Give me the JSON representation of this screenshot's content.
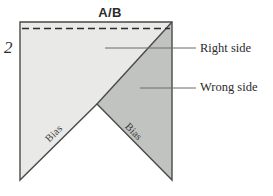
{
  "figure": {
    "title": "A/B",
    "step_number": "2",
    "colors": {
      "right_side_fill": "#e9e9e7",
      "wrong_side_fill": "#c1c3c1",
      "outline": "#4a4a4a",
      "fold_line": "#2b2b2b",
      "leader_line": "#6b6b6b",
      "text": "#2b2b2b",
      "background": "#ffffff"
    },
    "regions": [
      {
        "name": "right-side",
        "label": "Right side",
        "fill": "#e9e9e7",
        "points": "20,22 172,22 97,104 20,180"
      },
      {
        "name": "wrong-side",
        "label": "Wrong side",
        "fill": "#c1c3c1",
        "points": "172,22 172,180 97,104"
      }
    ],
    "callouts": [
      {
        "name": "right-side",
        "text": "Right side",
        "line_from": [
          105,
          48
        ],
        "line_to": [
          196,
          48
        ]
      },
      {
        "name": "wrong-side",
        "text": "Wrong side",
        "line_from": [
          140,
          88
        ],
        "line_to": [
          196,
          88
        ]
      }
    ],
    "bias_labels": [
      {
        "name": "bias-left",
        "text": "Bias",
        "rotation_deg": -45
      },
      {
        "name": "bias-right",
        "text": "Bias",
        "rotation_deg": 45
      }
    ],
    "fold_line": {
      "name": "dashed-fold-line",
      "from": [
        22,
        28
      ],
      "to": [
        170,
        28
      ],
      "dash": "7,4"
    },
    "outline_path": "M20,22 L172,22 L172,180 L97,104 L20,180 Z"
  }
}
